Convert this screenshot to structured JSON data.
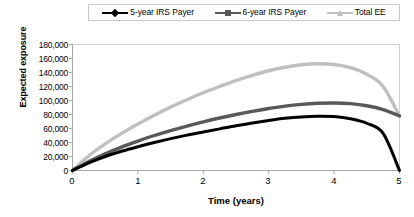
{
  "legend": {
    "position": "top",
    "items": [
      {
        "label": "5-year IRS Payer",
        "color": "#000000",
        "marker": "diamond"
      },
      {
        "label": "6-year IRS Payer",
        "color": "#595959",
        "marker": "square"
      },
      {
        "label": "Total EE",
        "color": "#bfbfbf",
        "marker": "triangle"
      }
    ]
  },
  "axes": {
    "y_title": "Expected exposure",
    "x_title": "Time (years)",
    "y_ticks": [
      "180,000",
      "160,000",
      "140,000",
      "120,000",
      "100,000",
      "80,000",
      "60,000",
      "40,000",
      "20,000",
      "0"
    ],
    "x_ticks": [
      "0",
      "1",
      "2",
      "3",
      "4",
      "5"
    ]
  },
  "chart_data": {
    "type": "line",
    "title": "",
    "xlabel": "Time (years)",
    "ylabel": "Expected exposure",
    "xlim": [
      0,
      5
    ],
    "ylim": [
      0,
      180000
    ],
    "ytick_values": [
      0,
      20000,
      40000,
      60000,
      80000,
      100000,
      120000,
      140000,
      160000,
      180000
    ],
    "xtick_values": [
      0,
      1,
      2,
      3,
      4,
      5
    ],
    "grid": false,
    "legend_position": "top",
    "x": [
      0,
      0.25,
      0.5,
      0.75,
      1,
      1.25,
      1.5,
      1.75,
      2,
      2.25,
      2.5,
      2.75,
      3,
      3.25,
      3.5,
      3.75,
      4,
      4.25,
      4.5,
      4.75,
      5
    ],
    "series": [
      {
        "name": "5-year IRS Payer",
        "color": "#000000",
        "marker": "diamond",
        "values": [
          0,
          11000,
          20000,
          27500,
          34000,
          40000,
          45500,
          50500,
          55000,
          59500,
          64000,
          68000,
          71500,
          74500,
          76500,
          77500,
          77000,
          74000,
          67500,
          53000,
          0
        ]
      },
      {
        "name": "6-year IRS Payer",
        "color": "#595959",
        "marker": "square",
        "values": [
          0,
          13000,
          24000,
          33500,
          42000,
          50000,
          57000,
          63500,
          69500,
          75000,
          80000,
          84500,
          88500,
          92000,
          94500,
          96000,
          96500,
          95500,
          92500,
          87000,
          78000
        ]
      },
      {
        "name": "Total EE",
        "color": "#bfbfbf",
        "marker": "triangle",
        "values": [
          0,
          21000,
          38000,
          53000,
          66500,
          79000,
          90500,
          101000,
          111000,
          120000,
          128500,
          136000,
          142500,
          147500,
          151000,
          152500,
          151500,
          147000,
          137500,
          120000,
          78000
        ]
      }
    ]
  }
}
